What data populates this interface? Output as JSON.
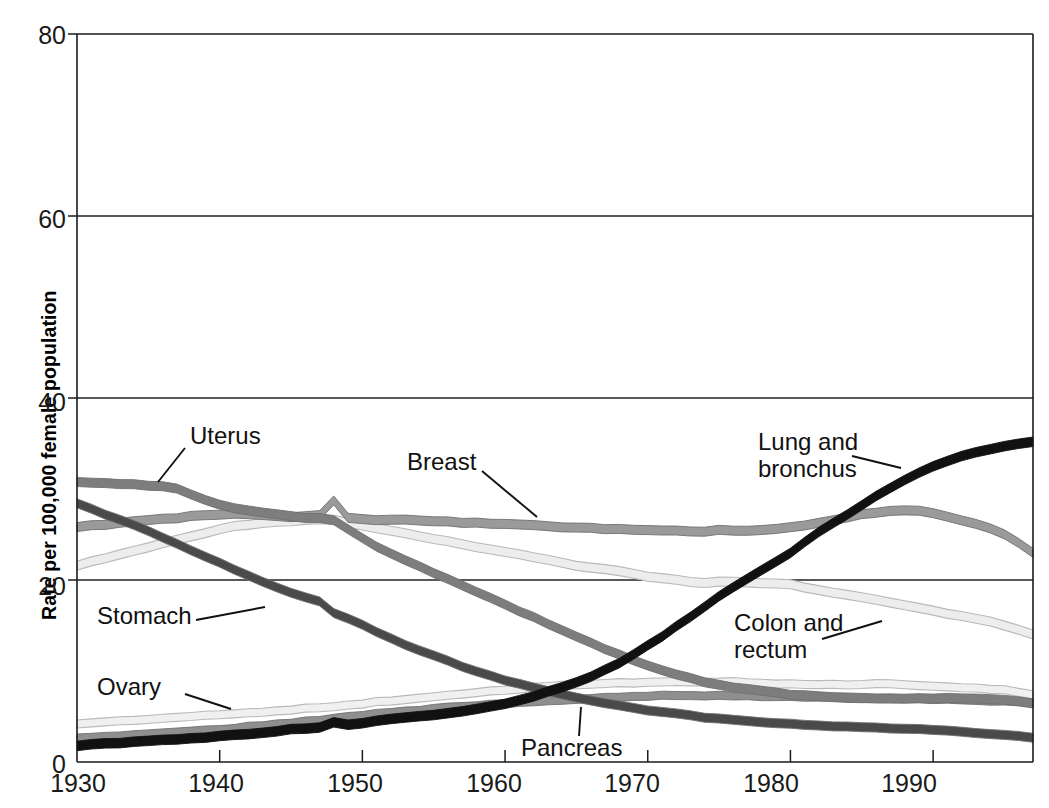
{
  "chart_data": {
    "type": "line",
    "title": "",
    "subtitle": "",
    "xlabel": "",
    "ylabel": "Rate per 100,000 female population",
    "xlim": [
      1930,
      1997
    ],
    "ylim": [
      0,
      80
    ],
    "yticks": [
      0,
      20,
      40,
      60,
      80
    ],
    "xticks": [
      1930,
      1940,
      1950,
      1960,
      1970,
      1980,
      1990
    ],
    "grid": "horizontal",
    "legend_position": "inline-annotations",
    "annotations": [
      {
        "text": "Uterus",
        "series": "Uterus"
      },
      {
        "text": "Breast",
        "series": "Breast"
      },
      {
        "text": "Lung and bronchus",
        "series": "Lung and bronchus"
      },
      {
        "text": "Stomach",
        "series": "Stomach"
      },
      {
        "text": "Colon and rectum",
        "series": "Colon and rectum"
      },
      {
        "text": "Ovary",
        "series": "Ovary"
      },
      {
        "text": "Pancreas",
        "series": "Pancreas"
      }
    ],
    "x": [
      1930,
      1931,
      1932,
      1933,
      1934,
      1935,
      1936,
      1937,
      1938,
      1939,
      1940,
      1941,
      1942,
      1943,
      1944,
      1945,
      1946,
      1947,
      1948,
      1949,
      1950,
      1951,
      1952,
      1953,
      1954,
      1955,
      1956,
      1957,
      1958,
      1959,
      1960,
      1961,
      1962,
      1963,
      1964,
      1965,
      1966,
      1967,
      1968,
      1969,
      1970,
      1971,
      1972,
      1973,
      1974,
      1975,
      1976,
      1977,
      1978,
      1979,
      1980,
      1981,
      1982,
      1983,
      1984,
      1985,
      1986,
      1987,
      1988,
      1989,
      1990,
      1991,
      1992,
      1993,
      1994,
      1995,
      1996,
      1997
    ],
    "series": [
      {
        "name": "Lung and bronchus",
        "color": "#111111",
        "values": [
          1.8,
          1.9,
          2.0,
          2.1,
          2.2,
          2.3,
          2.4,
          2.5,
          2.6,
          2.7,
          2.9,
          3.0,
          3.1,
          3.2,
          3.4,
          3.6,
          3.7,
          3.8,
          4.4,
          4.1,
          4.3,
          4.5,
          4.7,
          4.9,
          5.0,
          5.2,
          5.4,
          5.6,
          5.8,
          6.1,
          6.4,
          6.8,
          7.2,
          7.7,
          8.2,
          8.8,
          9.4,
          10.1,
          10.9,
          11.8,
          12.8,
          13.8,
          14.9,
          16.0,
          17.1,
          18.2,
          19.2,
          20.2,
          21.1,
          22.0,
          23.0,
          24.2,
          25.3,
          26.3,
          27.2,
          28.2,
          29.2,
          30.1,
          31.0,
          31.8,
          32.5,
          33.1,
          33.6,
          34.0,
          34.4,
          34.7,
          35.0,
          35.2
        ]
      },
      {
        "name": "Breast",
        "color": "#9a9a9a",
        "values": [
          25.8,
          26.0,
          26.1,
          26.3,
          26.5,
          26.6,
          26.7,
          26.8,
          27.0,
          27.1,
          27.2,
          27.3,
          27.2,
          27.1,
          27.0,
          26.9,
          27.0,
          27.1,
          28.7,
          26.8,
          26.7,
          26.6,
          26.6,
          26.6,
          26.5,
          26.5,
          26.4,
          26.3,
          26.3,
          26.2,
          26.2,
          26.1,
          26.0,
          25.9,
          25.8,
          25.8,
          25.7,
          25.6,
          25.6,
          25.5,
          25.5,
          25.4,
          25.4,
          25.3,
          25.3,
          25.5,
          25.4,
          25.4,
          25.5,
          25.6,
          25.8,
          26.0,
          26.3,
          26.6,
          26.9,
          27.2,
          27.4,
          27.6,
          27.7,
          27.6,
          27.3,
          27.0,
          26.6,
          26.2,
          25.7,
          25.0,
          24.1,
          23.0
        ]
      },
      {
        "name": "Uterus",
        "color": "#7d7d7d",
        "values": [
          30.8,
          30.7,
          30.6,
          30.5,
          30.5,
          30.4,
          30.3,
          30.0,
          29.4,
          28.8,
          28.3,
          27.9,
          27.6,
          27.4,
          27.2,
          27.0,
          26.8,
          26.8,
          26.6,
          25.6,
          24.6,
          23.7,
          22.9,
          22.2,
          21.5,
          20.8,
          20.1,
          19.4,
          18.7,
          18.0,
          17.3,
          16.6,
          15.9,
          15.2,
          14.5,
          13.8,
          13.1,
          12.4,
          11.8,
          11.2,
          10.6,
          10.1,
          9.6,
          9.2,
          8.8,
          8.5,
          8.2,
          8.0,
          7.8,
          7.6,
          7.4,
          7.3,
          7.2,
          7.1,
          7.1,
          7.0,
          7.0,
          7.0,
          7.0,
          7.0,
          7.0,
          7.0,
          7.0,
          7.0,
          6.9,
          6.8,
          6.7,
          6.4
        ]
      },
      {
        "name": "Stomach",
        "color": "#4a4a4a",
        "values": [
          28.4,
          27.8,
          27.2,
          26.6,
          26.0,
          25.4,
          24.7,
          24.0,
          23.3,
          22.6,
          21.9,
          21.2,
          20.5,
          19.8,
          19.2,
          18.6,
          18.1,
          17.6,
          16.4,
          15.8,
          15.1,
          14.3,
          13.6,
          12.9,
          12.3,
          11.7,
          11.1,
          10.5,
          10.0,
          9.5,
          9.0,
          8.6,
          8.2,
          7.8,
          7.4,
          7.1,
          6.8,
          6.5,
          6.2,
          5.9,
          5.7,
          5.5,
          5.3,
          5.1,
          4.9,
          4.8,
          4.6,
          4.5,
          4.4,
          4.3,
          4.2,
          4.1,
          4.0,
          3.9,
          3.9,
          3.8,
          3.8,
          3.7,
          3.6,
          3.6,
          3.5,
          3.4,
          3.3,
          3.2,
          3.1,
          3.0,
          2.9,
          2.7
        ]
      },
      {
        "name": "Colon and rectum",
        "color": "#ededed",
        "values": [
          21.6,
          22.0,
          22.4,
          22.8,
          23.2,
          23.6,
          24.0,
          24.4,
          24.8,
          25.2,
          25.6,
          25.9,
          26.1,
          26.3,
          26.4,
          26.5,
          26.6,
          26.7,
          26.6,
          26.3,
          26.0,
          25.7,
          25.4,
          25.1,
          24.8,
          24.5,
          24.2,
          23.9,
          23.6,
          23.4,
          23.1,
          22.8,
          22.5,
          22.2,
          21.9,
          21.6,
          21.4,
          21.2,
          21.0,
          20.7,
          20.4,
          20.2,
          20.0,
          19.8,
          19.7,
          19.8,
          19.8,
          19.7,
          19.6,
          19.6,
          19.5,
          19.2,
          18.9,
          18.6,
          18.4,
          18.1,
          17.8,
          17.5,
          17.2,
          16.9,
          16.6,
          16.3,
          16.0,
          15.7,
          15.4,
          15.0,
          14.5,
          14.0
        ]
      },
      {
        "name": "Ovary",
        "color": "#f0f0f0",
        "values": [
          4.2,
          4.3,
          4.4,
          4.5,
          4.6,
          4.7,
          4.8,
          4.9,
          5.0,
          5.1,
          5.2,
          5.3,
          5.4,
          5.5,
          5.6,
          5.7,
          5.9,
          6.0,
          6.1,
          6.3,
          6.4,
          6.6,
          6.7,
          6.9,
          7.0,
          7.2,
          7.3,
          7.5,
          7.6,
          7.8,
          7.9,
          8.0,
          8.2,
          8.3,
          8.4,
          8.5,
          8.6,
          8.6,
          8.7,
          8.7,
          8.8,
          8.8,
          8.8,
          8.8,
          8.8,
          8.8,
          8.8,
          8.7,
          8.7,
          8.6,
          8.6,
          8.5,
          8.5,
          8.5,
          8.5,
          8.5,
          8.6,
          8.6,
          8.5,
          8.4,
          8.3,
          8.3,
          8.2,
          8.1,
          8.0,
          7.9,
          7.7,
          7.4
        ]
      },
      {
        "name": "Pancreas",
        "color": "#8f8f8f",
        "values": [
          2.6,
          2.7,
          2.8,
          2.9,
          3.0,
          3.1,
          3.2,
          3.3,
          3.4,
          3.5,
          3.6,
          3.7,
          3.9,
          4.0,
          4.2,
          4.3,
          4.5,
          4.6,
          4.8,
          5.0,
          5.1,
          5.3,
          5.4,
          5.6,
          5.7,
          5.9,
          6.0,
          6.1,
          6.2,
          6.3,
          6.4,
          6.5,
          6.6,
          6.7,
          6.8,
          6.9,
          7.0,
          7.1,
          7.1,
          7.2,
          7.2,
          7.3,
          7.3,
          7.3,
          7.3,
          7.3,
          7.3,
          7.3,
          7.2,
          7.2,
          7.2,
          7.1,
          7.1,
          7.1,
          7.0,
          7.0,
          7.0,
          7.0,
          7.0,
          7.0,
          6.9,
          6.9,
          6.8,
          6.8,
          6.7,
          6.7,
          6.6,
          6.5
        ]
      }
    ]
  },
  "axes": {
    "ylabel": "Rate per 100,000 female population",
    "yticks": [
      "80",
      "60",
      "40",
      "20",
      "0"
    ],
    "xticks": [
      "1930",
      "1940",
      "1950",
      "1960",
      "1970",
      "1980",
      "1990"
    ]
  },
  "labels": {
    "uterus": "Uterus",
    "breast": "Breast",
    "lung_line1": "Lung and",
    "lung_line2": "bronchus",
    "stomach": "Stomach",
    "colon_line1": "Colon and",
    "colon_line2": "rectum",
    "ovary": "Ovary",
    "pancreas": "Pancreas"
  }
}
